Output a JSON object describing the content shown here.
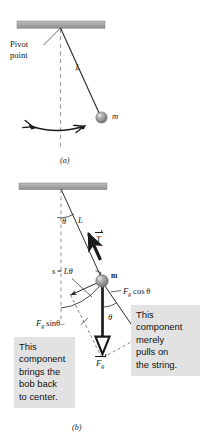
{
  "figure": {
    "title_a": "(a)",
    "title_b": "(b)"
  },
  "panel_a": {
    "pivot_label_line1": "Pivot",
    "pivot_label_line2": "point",
    "length_label": "L",
    "mass_label": "m",
    "caption": "(a)",
    "colors": {
      "ceiling": "#a8a8a8",
      "bob": "#8c8c8c",
      "line": "#2b2b2b",
      "dash": "#9a9a9a"
    }
  },
  "panel_b": {
    "angle_label": "θ",
    "length_label": "L",
    "tension_label": "T",
    "arc_label_s": "s",
    "arc_label_eq": "=",
    "arc_label_L": "L",
    "arc_label_theta": "θ",
    "mass_label": "m",
    "fg_cos_F": "F",
    "fg_cos_sub": "g",
    "fg_cos_rest": "cos θ",
    "fg_sin_F": "F",
    "fg_sin_sub": "g",
    "fg_sin_rest": "sinθ",
    "fg_sin_dash": "–",
    "weight_F": "F",
    "weight_sub": "g",
    "angle_label2": "θ",
    "caption": "(b)",
    "colors": {
      "ceiling": "#a8a8a8",
      "bob": "#8c8c8c",
      "string": "#1a1a1a",
      "dash": "#9a9a9a",
      "callout_bg": "#e2e2e2"
    }
  },
  "callout_left": {
    "lines": [
      "This",
      "component",
      "brings the",
      "bob back",
      "to center."
    ]
  },
  "callout_right": {
    "lines": [
      "This",
      "component",
      "merely",
      "pulls on",
      "the string."
    ]
  }
}
